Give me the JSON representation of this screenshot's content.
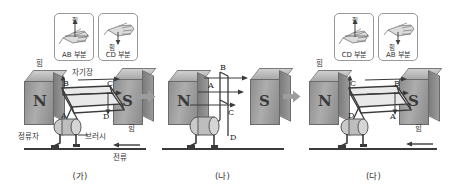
{
  "figure": {
    "background": "#ffffff",
    "separator_icon": "right-arrow-icon"
  },
  "labels": {
    "force": "힘",
    "magnetic_field": "자기장",
    "commutator": "정류자",
    "brush": "브러시",
    "current": "전류",
    "pole_north": "N",
    "pole_south": "S",
    "hand_ab": "AB 부분",
    "hand_cd": "CD 부분",
    "point_a": "A",
    "point_b": "B",
    "point_c": "C",
    "point_d": "D"
  },
  "panels": [
    {
      "id": "ga",
      "caption": "(가)",
      "hand_boxes": [
        {
          "label": "AB 부분",
          "force_label": "힘",
          "icon": "left-hand-rule-icon",
          "force_dir": "up"
        },
        {
          "label": "CD 부분",
          "force_label": "힘",
          "icon": "left-hand-rule-icon",
          "force_dir": "down"
        }
      ],
      "field_label": "자기장",
      "coil_points": [
        "B",
        "C",
        "A",
        "D"
      ],
      "force_labels": [
        "힘",
        "힘"
      ],
      "parts": [
        "정류자",
        "브러시"
      ],
      "current_label": "전류",
      "poles": [
        "N",
        "S"
      ]
    },
    {
      "id": "na",
      "caption": "(나)",
      "hand_boxes": [],
      "coil_points": [
        "B",
        "A",
        "C",
        "D"
      ],
      "poles": [
        "N",
        "S"
      ]
    },
    {
      "id": "da",
      "caption": "(다)",
      "hand_boxes": [
        {
          "label": "CD 부분",
          "force_label": "힘",
          "icon": "left-hand-rule-icon",
          "force_dir": "up"
        },
        {
          "label": "AB 부분",
          "force_label": "힘",
          "icon": "left-hand-rule-icon",
          "force_dir": "down"
        }
      ],
      "coil_points": [
        "C",
        "B",
        "D",
        "A"
      ],
      "force_labels": [
        "힘",
        "힘"
      ],
      "poles": [
        "N",
        "S"
      ]
    }
  ],
  "colors": {
    "magnet_face": "#9b9b9b",
    "magnet_top": "#c2c2c2",
    "line": "#3a3a3a",
    "border": "#999999",
    "text": "#222222"
  }
}
